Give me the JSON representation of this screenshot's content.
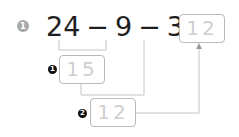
{
  "problem": {
    "number": "1",
    "expression": {
      "a": "24",
      "op1": "−",
      "b": "9",
      "op2": "−",
      "c": "3",
      "eq": "="
    },
    "answer": "12"
  },
  "steps": [
    {
      "marker": "1",
      "value": "15"
    },
    {
      "marker": "2",
      "value": "12"
    }
  ],
  "colors": {
    "badge": "#a8a8a8",
    "text": "#1f1f1f",
    "box_border": "#b9b9b9",
    "box_text": "#cfcfcf",
    "line": "#c4c4c4",
    "marker": "#111111"
  }
}
